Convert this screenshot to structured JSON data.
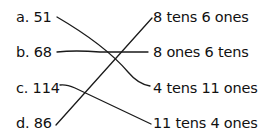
{
  "left_items": [
    {
      "letter": "a.",
      "value": "51"
    },
    {
      "letter": "b.",
      "value": "68"
    },
    {
      "letter": "c.",
      "value": "114"
    },
    {
      "letter": "d.",
      "value": "86"
    }
  ],
  "right_items": [
    "8 tens 6 ones",
    "8 ones 6 tens",
    "4 tens 11 ones",
    "11 tens 4 ones"
  ],
  "matches": [
    {
      "from": "a. 51",
      "to": "4 tens 11 ones"
    },
    {
      "from": "b. 68",
      "to": "8 ones 6 tens"
    },
    {
      "from": "c. 114",
      "to": "11 tens 4 ones"
    },
    {
      "from": "d. 86",
      "to": "8 tens 6 ones"
    }
  ]
}
